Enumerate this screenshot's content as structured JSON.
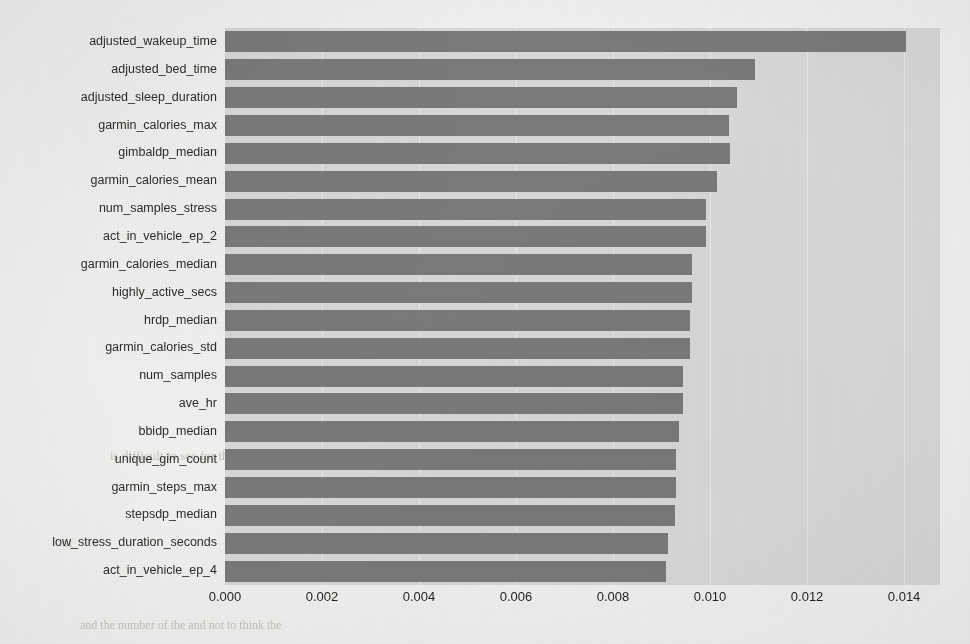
{
  "chart_data": {
    "type": "bar",
    "orientation": "horizontal",
    "title": "",
    "xlabel": "",
    "ylabel": "",
    "categories": [
      "adjusted_wakeup_time",
      "adjusted_bed_time",
      "adjusted_sleep_duration",
      "garmin_calories_max",
      "gimbaldp_median",
      "garmin_calories_mean",
      "num_samples_stress",
      "act_in_vehicle_ep_2",
      "garmin_calories_median",
      "highly_active_secs",
      "hrdp_median",
      "garmin_calories_std",
      "num_samples",
      "ave_hr",
      "bbidp_median",
      "unique_gim_count",
      "garmin_steps_max",
      "stepsdp_median",
      "low_stress_duration_seconds",
      "act_in_vehicle_ep_4"
    ],
    "values": [
      0.01404,
      0.01093,
      0.01056,
      0.0104,
      0.01041,
      0.01014,
      0.00992,
      0.00991,
      0.00963,
      0.00963,
      0.00959,
      0.00959,
      0.00945,
      0.00945,
      0.00936,
      0.0093,
      0.0093,
      0.00928,
      0.00913,
      0.0091
    ],
    "xlim": [
      0.0,
      0.01474
    ],
    "ylim": [
      -0.5,
      19.5
    ],
    "xticks": [
      0.0,
      0.002,
      0.004,
      0.006,
      0.008,
      0.01,
      0.012,
      0.014
    ],
    "xtick_labels": [
      "0.000",
      "0.002",
      "0.004",
      "0.006",
      "0.008",
      "0.010",
      "0.012",
      "0.014"
    ],
    "grid": true,
    "legend": null,
    "bar_color": "#7b7a78",
    "plot_bg_color": "#d9d8d6",
    "figure_bg_color": "#f2f1ef"
  },
  "background_ghost_text": [
    {
      "text": "the Nature",
      "x": 620,
      "y": 372,
      "size": 13
    },
    {
      "text": "is difficult to see for the",
      "x": 110,
      "y": 448,
      "size": 13
    },
    {
      "text": "and",
      "x": 430,
      "y": 449,
      "size": 13
    },
    {
      "text": "the",
      "x": 735,
      "y": 505,
      "size": 13
    },
    {
      "text": "of",
      "x": 62,
      "y": 535,
      "size": 13
    },
    {
      "text": "and the number of the and not to think the",
      "x": 80,
      "y": 618,
      "size": 12
    },
    {
      "text": "lines",
      "x": 300,
      "y": 336,
      "size": 12
    }
  ]
}
